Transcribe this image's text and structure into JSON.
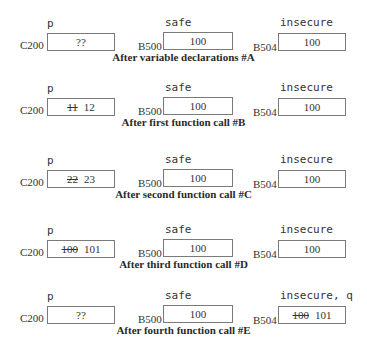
{
  "panels": [
    {
      "caption": "After variable declarations #A",
      "p": {
        "label": "p",
        "address": "C200",
        "old": "",
        "value": "??"
      },
      "safe": {
        "label": "safe",
        "address": "B500",
        "old": "",
        "value": "100"
      },
      "insecure": {
        "label": "insecure",
        "address": "B504",
        "old": "",
        "value": "100"
      }
    },
    {
      "caption": "After first function call #B",
      "p": {
        "label": "p",
        "address": "C200",
        "old": "11",
        "value": "12"
      },
      "safe": {
        "label": "safe",
        "address": "B500",
        "old": "",
        "value": "100"
      },
      "insecure": {
        "label": "insecure",
        "address": "B504",
        "old": "",
        "value": "100"
      }
    },
    {
      "caption": "After second function call #C",
      "p": {
        "label": "p",
        "address": "C200",
        "old": "22",
        "value": "23"
      },
      "safe": {
        "label": "safe",
        "address": "B500",
        "old": "",
        "value": "100"
      },
      "insecure": {
        "label": "insecure",
        "address": "B504",
        "old": "",
        "value": "100"
      }
    },
    {
      "caption": "After third function call #D",
      "p": {
        "label": "p",
        "address": "C200",
        "old": "100",
        "value": "101"
      },
      "safe": {
        "label": "safe",
        "address": "B500",
        "old": "",
        "value": "100"
      },
      "insecure": {
        "label": "insecure",
        "address": "B504",
        "old": "",
        "value": "100"
      }
    },
    {
      "caption": "After fourth function call #E",
      "p": {
        "label": "p",
        "address": "C200",
        "old": "",
        "value": "??"
      },
      "safe": {
        "label": "safe",
        "address": "B500",
        "old": "",
        "value": "100"
      },
      "insecure": {
        "label": "insecure, q",
        "address": "B504",
        "old": "100",
        "value": "101"
      }
    }
  ]
}
